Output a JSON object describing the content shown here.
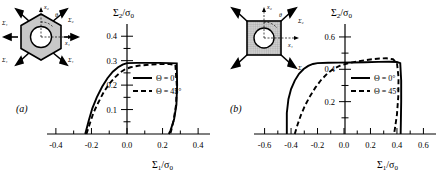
{
  "figure": {
    "background": "#ffffff",
    "ink": "#000000"
  },
  "panels": [
    {
      "id": "a",
      "panel_label": "(a)",
      "inset": {
        "shape": "hexagon-with-circular-hole",
        "fill": "#c8c8c8",
        "axis_labels": {
          "x": "x₁",
          "y": "x₂",
          "angle": "θ"
        },
        "arrow_labels": [
          "Σ₁",
          "Σ₂",
          "Σ₁",
          "Σ₁",
          "Σ₁",
          "Σ₁"
        ]
      },
      "chart_data": {
        "type": "line",
        "title": "",
        "xlabel": "Σ₁/σ₀",
        "ylabel": "Σ₂/σ₀",
        "xlim": [
          -0.45,
          0.45
        ],
        "ylim": [
          0.0,
          0.45
        ],
        "xticks": [
          -0.4,
          -0.3,
          -0.2,
          -0.1,
          0.0,
          0.1,
          0.2,
          0.3,
          0.4
        ],
        "xticklabels": [
          "-0.4",
          "",
          "-0.2",
          "",
          "0.0",
          "",
          "0.2",
          "",
          "0.4"
        ],
        "yticks": [
          0.0,
          0.05,
          0.1,
          0.15,
          0.2,
          0.25,
          0.3,
          0.35,
          0.4
        ],
        "yticklabels": [
          "",
          "",
          "0.1",
          "",
          "0.2",
          "",
          "0.3",
          "",
          "0.4"
        ],
        "grid": false,
        "legend_position": "center",
        "series": [
          {
            "name": "Θ = 0°",
            "style": "solid",
            "points": [
              [
                -0.235,
                0.0
              ],
              [
                -0.215,
                0.055
              ],
              [
                -0.195,
                0.105
              ],
              [
                -0.17,
                0.15
              ],
              [
                -0.14,
                0.193
              ],
              [
                -0.11,
                0.228
              ],
              [
                -0.08,
                0.255
              ],
              [
                -0.05,
                0.273
              ],
              [
                -0.025,
                0.284
              ],
              [
                0.0,
                0.29
              ],
              [
                0.06,
                0.291
              ],
              [
                0.12,
                0.291
              ],
              [
                0.18,
                0.291
              ],
              [
                0.24,
                0.29
              ],
              [
                0.28,
                0.289
              ],
              [
                0.282,
                0.2
              ],
              [
                0.278,
                0.12
              ],
              [
                0.265,
                0.06
              ],
              [
                0.245,
                0.015
              ],
              [
                0.235,
                0.0
              ]
            ]
          },
          {
            "name": "Θ = 45°",
            "style": "dashed",
            "points": [
              [
                -0.228,
                0.0
              ],
              [
                -0.208,
                0.045
              ],
              [
                -0.188,
                0.088
              ],
              [
                -0.162,
                0.128
              ],
              [
                -0.132,
                0.17
              ],
              [
                -0.1,
                0.205
              ],
              [
                -0.068,
                0.232
              ],
              [
                -0.038,
                0.252
              ],
              [
                -0.01,
                0.265
              ],
              [
                0.02,
                0.273
              ],
              [
                0.07,
                0.28
              ],
              [
                0.13,
                0.284
              ],
              [
                0.19,
                0.286
              ],
              [
                0.24,
                0.286
              ],
              [
                0.272,
                0.283
              ],
              [
                0.28,
                0.2
              ],
              [
                0.276,
                0.12
              ],
              [
                0.262,
                0.055
              ],
              [
                0.248,
                0.012
              ],
              [
                0.243,
                0.0
              ]
            ]
          }
        ]
      }
    },
    {
      "id": "b",
      "panel_label": "(b)",
      "inset": {
        "shape": "square-with-circular-hole",
        "fill": "#c0c0c0",
        "axis_labels": {
          "x": "x₁",
          "y": "x₂",
          "angle": "θ"
        },
        "arrow_labels": [
          "Σ₂",
          "Σ₁"
        ]
      },
      "chart_data": {
        "type": "line",
        "title": "",
        "xlabel": "Σ₁/σ₀",
        "ylabel": "Σ₂/σ₀",
        "xlim": [
          -0.68,
          0.68
        ],
        "ylim": [
          0.0,
          0.68
        ],
        "xticks": [
          -0.6,
          -0.5,
          -0.4,
          -0.3,
          -0.2,
          -0.1,
          0.0,
          0.1,
          0.2,
          0.3,
          0.4,
          0.5,
          0.6
        ],
        "xticklabels": [
          "-0.6",
          "",
          "-0.4",
          "",
          "-0.2",
          "",
          "0.0",
          "",
          "0.2",
          "",
          "0.4",
          "",
          "0.6"
        ],
        "yticks": [
          0.0,
          0.1,
          0.2,
          0.3,
          0.4,
          0.5,
          0.6
        ],
        "yticklabels": [
          "",
          "",
          "0.2",
          "",
          "0.4",
          "",
          "0.6"
        ],
        "grid": false,
        "legend_position": "center",
        "series": [
          {
            "name": "Θ = 0°",
            "style": "solid",
            "points": [
              [
                -0.432,
                0.0
              ],
              [
                -0.432,
                0.13
              ],
              [
                -0.42,
                0.215
              ],
              [
                -0.4,
                0.278
              ],
              [
                -0.372,
                0.33
              ],
              [
                -0.34,
                0.372
              ],
              [
                -0.305,
                0.402
              ],
              [
                -0.27,
                0.421
              ],
              [
                -0.235,
                0.433
              ],
              [
                -0.2,
                0.438
              ],
              [
                -0.12,
                0.44
              ],
              [
                -0.04,
                0.441
              ],
              [
                0.06,
                0.442
              ],
              [
                0.16,
                0.444
              ],
              [
                0.26,
                0.446
              ],
              [
                0.34,
                0.447
              ],
              [
                0.4,
                0.445
              ],
              [
                0.425,
                0.438
              ],
              [
                0.432,
                0.33
              ],
              [
                0.432,
                0.2
              ],
              [
                0.43,
                0.09
              ],
              [
                0.428,
                0.0
              ]
            ]
          },
          {
            "name": "Θ = 45°",
            "style": "dashed",
            "points": [
              [
                -0.372,
                0.0
              ],
              [
                -0.35,
                0.06
              ],
              [
                -0.325,
                0.118
              ],
              [
                -0.295,
                0.175
              ],
              [
                -0.258,
                0.232
              ],
              [
                -0.218,
                0.285
              ],
              [
                -0.175,
                0.332
              ],
              [
                -0.128,
                0.372
              ],
              [
                -0.08,
                0.402
              ],
              [
                -0.03,
                0.422
              ],
              [
                0.03,
                0.437
              ],
              [
                0.09,
                0.447
              ],
              [
                0.15,
                0.455
              ],
              [
                0.21,
                0.462
              ],
              [
                0.27,
                0.467
              ],
              [
                0.32,
                0.468
              ],
              [
                0.37,
                0.462
              ],
              [
                0.4,
                0.44
              ],
              [
                0.412,
                0.35
              ],
              [
                0.41,
                0.23
              ],
              [
                0.4,
                0.12
              ],
              [
                0.385,
                0.035
              ],
              [
                0.378,
                0.0
              ]
            ]
          }
        ]
      }
    }
  ]
}
